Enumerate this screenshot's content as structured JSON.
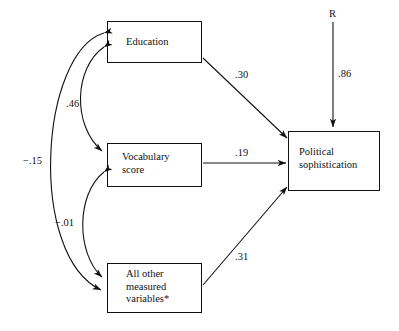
{
  "figure": {
    "type": "path-diagram",
    "title": "",
    "footnote_marker": "*"
  },
  "nodes": [
    {
      "id": "education",
      "label": "Education",
      "x": 107,
      "y": 21,
      "w": 95,
      "h": 42,
      "text_x": 126,
      "text_y": 36
    },
    {
      "id": "vocabulary",
      "label": "Vocabulary\nscore",
      "x": 107,
      "y": 143,
      "w": 95,
      "h": 44,
      "text_x": 122,
      "text_y": 151
    },
    {
      "id": "all_other",
      "label": "All other\nmeasured\nvariables*",
      "x": 107,
      "y": 263,
      "w": 95,
      "h": 50,
      "text_x": 126,
      "text_y": 268
    },
    {
      "id": "political",
      "label": "Political\nsophistication",
      "x": 288,
      "y": 131,
      "w": 92,
      "h": 60,
      "text_x": 299,
      "text_y": 146
    }
  ],
  "residual": {
    "label": "R",
    "label_x": 329,
    "label_y": 8,
    "coefficient": ".86",
    "coefficient_x": 338,
    "coefficient_y": 68
  },
  "paths": [
    {
      "id": "education-to-political",
      "from": "education",
      "to": "political",
      "coefficient": ".30",
      "label_x": 235,
      "label_y": 69
    },
    {
      "id": "vocabulary-to-political",
      "from": "vocabulary",
      "to": "political",
      "coefficient": ".19",
      "label_x": 235,
      "label_y": 147
    },
    {
      "id": "allother-to-political",
      "from": "all_other",
      "to": "political",
      "coefficient": ".31",
      "label_x": 235,
      "label_y": 251
    }
  ],
  "correlations": [
    {
      "id": "education-vocabulary",
      "between": [
        "education",
        "vocabulary"
      ],
      "coefficient": ".46",
      "label_x": 66,
      "label_y": 98
    },
    {
      "id": "vocabulary-allother",
      "between": [
        "vocabulary",
        "all_other"
      ],
      "coefficient": "−.01",
      "label_x": 55,
      "label_y": 217
    },
    {
      "id": "education-allother",
      "between": [
        "education",
        "all_other"
      ],
      "coefficient": "−.15",
      "label_x": 23,
      "label_y": 155
    }
  ],
  "colors": {
    "line": "#111111",
    "box_border": "#111111",
    "background": "#ffffff",
    "text": "#111111"
  }
}
